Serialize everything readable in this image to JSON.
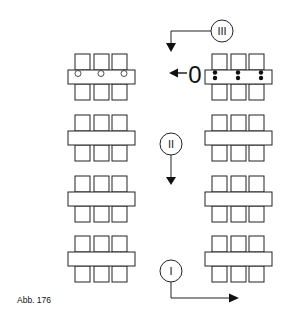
{
  "figure": {
    "caption": "Abb. 176"
  },
  "markers": {
    "start": "0",
    "step1": "I",
    "step2": "II",
    "step3": "III"
  },
  "tables": {
    "left_column_rows": 4,
    "right_column_rows": 4,
    "chairs_per_side": 3,
    "left_first_row_marks": "open-circles",
    "right_first_row_marks": "filled-double-dots"
  },
  "colors": {
    "stroke": "#222222",
    "fill": "#ffffff"
  }
}
